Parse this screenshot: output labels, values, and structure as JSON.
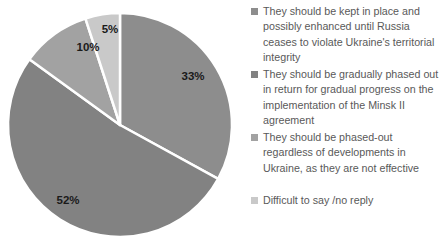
{
  "chart_data": {
    "type": "pie",
    "title": "",
    "subtitle": "",
    "xlabel": "",
    "ylabel": "",
    "legend_position": "right",
    "grid": false,
    "start_angle_deg": 0,
    "direction": "clockwise",
    "categories": [
      "They should be kept in place and possibly enhanced until Russia ceases to violate Ukraine's territorial integrity",
      "They should be gradually phased out in return for gradual progress on the implementation of the Minsk II agreement",
      "They should be phased-out regardless of developments in Ukraine, as they are not effective",
      "Difficult to say /no reply"
    ],
    "values": [
      33,
      52,
      10,
      5
    ],
    "value_labels": [
      "33%",
      "52%",
      "10%",
      "5%"
    ],
    "colors": [
      "#8d8d8d",
      "#828282",
      "#a2a2a2",
      "#c9c9c9"
    ],
    "annotations": []
  },
  "pie": {
    "labels": [
      {
        "text": "33%",
        "x": 193,
        "y": 76
      },
      {
        "text": "52%",
        "x": 68,
        "y": 200
      },
      {
        "text": "10%",
        "x": 88,
        "y": 47
      },
      {
        "text": "5%",
        "x": 110,
        "y": 29
      }
    ]
  },
  "legend": {
    "items": [
      {
        "label": "They should be kept in place and possibly enhanced until Russia ceases to violate Ukraine's territorial integrity",
        "color": "#8d8d8d",
        "top": 4
      },
      {
        "label": "They should be gradually phased out in return for gradual progress on the implementation of the Minsk II agreement",
        "color": "#828282",
        "top": 67
      },
      {
        "label": "They should be phased-out regardless of developments in Ukraine, as they are not effective",
        "color": "#a2a2a2",
        "top": 130
      },
      {
        "label": "Difficult to say /no reply",
        "color": "#c9c9c9",
        "top": 193
      }
    ]
  }
}
